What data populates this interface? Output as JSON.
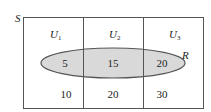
{
  "diagram": {
    "universe_label": "S",
    "ellipse_label": "R",
    "ellipse_fill": "#d9d9d9",
    "stroke": "#555555",
    "columns": [
      {
        "label": "U",
        "sub": "1",
        "inside": "5",
        "outside": "10"
      },
      {
        "label": "U",
        "sub": "2",
        "inside": "15",
        "outside": "20"
      },
      {
        "label": "U",
        "sub": "3",
        "inside": "20",
        "outside": "30"
      }
    ]
  }
}
